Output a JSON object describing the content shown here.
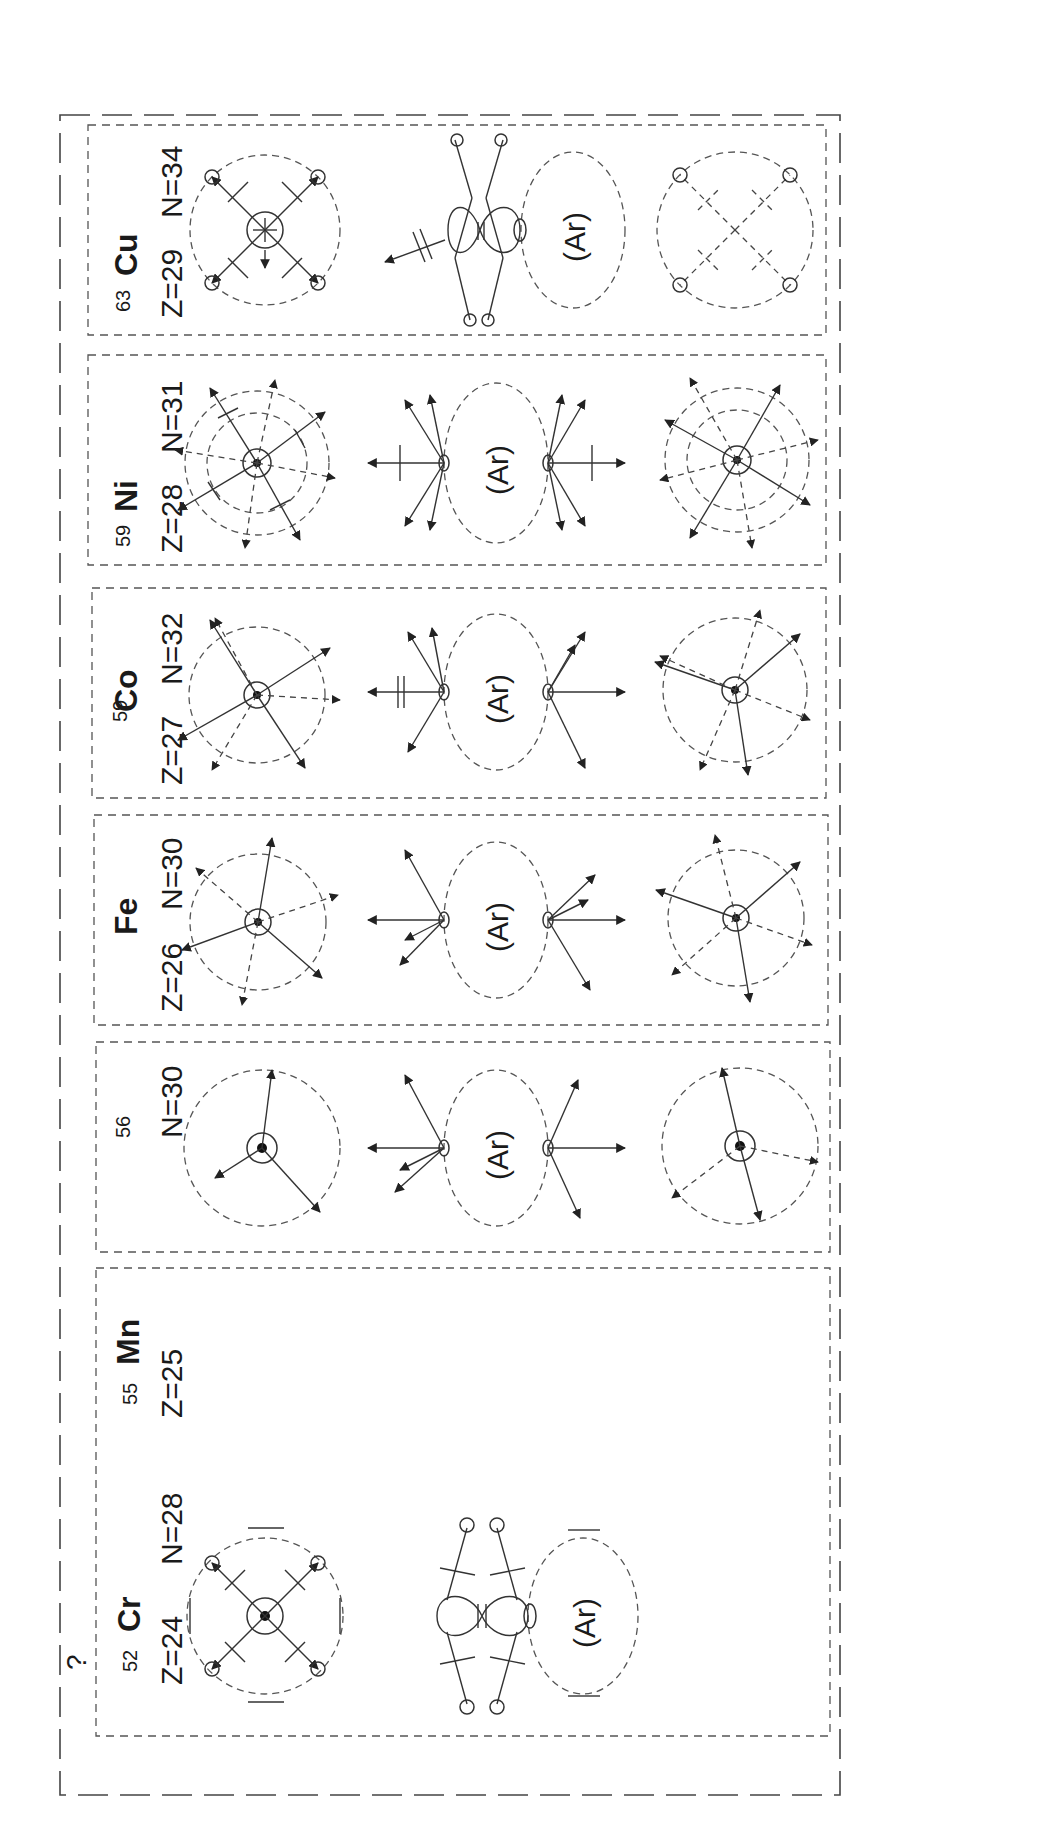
{
  "figure": {
    "outer_frame_marker": "?",
    "core_label": "(Ar)",
    "elements": [
      {
        "id": "cu",
        "symbol": "Cu",
        "mass_number": "63",
        "z_label": "Z=29",
        "n_label": "N=34",
        "style": "four-fold with figure-eight p-orbital and emitted electron"
      },
      {
        "id": "ni",
        "symbol": "Ni",
        "mass_number": "59",
        "z_label": "Z=28",
        "n_label": "N=31",
        "style": "multi-arm star"
      },
      {
        "id": "co",
        "symbol": "Co",
        "mass_number": "59",
        "z_label": "Z=27",
        "n_label": "N=32",
        "style": "multi-arm star"
      },
      {
        "id": "fe",
        "symbol": "Fe",
        "mass_number": "56",
        "z_label": "Z=26",
        "n_label": "N=30",
        "style": "multi-arm star"
      },
      {
        "id": "mn",
        "symbol": "Mn",
        "mass_number": "55",
        "z_label": "Z=25",
        "n_label": "N=30",
        "style": "three-arm star"
      },
      {
        "id": "cr",
        "symbol": "Cr",
        "mass_number": "52",
        "z_label": "Z=24",
        "n_label": "N=28",
        "style": "four-fold with figure-eight p-orbital"
      }
    ]
  },
  "colors": {
    "ink": "#1a1a1a",
    "line": "#333333",
    "dashed": "#555555",
    "background": "#ffffff"
  }
}
